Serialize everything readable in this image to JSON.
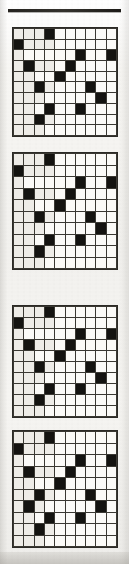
{
  "page": {
    "kind": "scanned-puzzle-page",
    "background_color": "#f4f3f0",
    "rule_color": "#262420",
    "grid_line_color": "#3a3832",
    "cell_empty_color": "#fbfaf7",
    "cell_filled_color": "#141310"
  },
  "grids": [
    {
      "name": "grid-1",
      "rows": 10,
      "cols": 10,
      "filled": [
        [
          0,
          0,
          0,
          1,
          0,
          0,
          0,
          0,
          0,
          0
        ],
        [
          1,
          0,
          0,
          0,
          0,
          0,
          0,
          0,
          0,
          0
        ],
        [
          0,
          0,
          0,
          0,
          0,
          0,
          1,
          0,
          0,
          1
        ],
        [
          0,
          1,
          0,
          0,
          0,
          1,
          0,
          0,
          0,
          0
        ],
        [
          0,
          0,
          0,
          0,
          1,
          0,
          0,
          0,
          0,
          0
        ],
        [
          0,
          0,
          1,
          0,
          0,
          0,
          0,
          1,
          0,
          0
        ],
        [
          0,
          0,
          0,
          0,
          0,
          0,
          0,
          0,
          1,
          0
        ],
        [
          0,
          0,
          0,
          1,
          0,
          0,
          1,
          0,
          0,
          0
        ],
        [
          0,
          0,
          1,
          0,
          0,
          0,
          0,
          0,
          0,
          0
        ],
        [
          0,
          0,
          0,
          0,
          0,
          0,
          0,
          0,
          0,
          0
        ]
      ],
      "shaded": [
        [
          1,
          1,
          1,
          0,
          0,
          0,
          0,
          0,
          0,
          0
        ],
        [
          0,
          1,
          1,
          1,
          0,
          0,
          0,
          0,
          0,
          0
        ],
        [
          1,
          0,
          0,
          0,
          0,
          0,
          0,
          0,
          0,
          0
        ],
        [
          1,
          0,
          1,
          1,
          0,
          0,
          0,
          0,
          0,
          0
        ],
        [
          1,
          1,
          0,
          0,
          0,
          0,
          0,
          0,
          0,
          0
        ],
        [
          1,
          1,
          0,
          1,
          0,
          0,
          0,
          0,
          0,
          0
        ],
        [
          1,
          1,
          1,
          0,
          0,
          0,
          0,
          0,
          0,
          0
        ],
        [
          1,
          1,
          0,
          0,
          0,
          0,
          0,
          0,
          0,
          0
        ],
        [
          1,
          1,
          0,
          1,
          0,
          0,
          0,
          0,
          0,
          0
        ],
        [
          1,
          1,
          1,
          0,
          0,
          0,
          0,
          0,
          0,
          0
        ]
      ]
    },
    {
      "name": "grid-2",
      "rows": 10,
      "cols": 10,
      "filled": [
        [
          0,
          0,
          0,
          1,
          0,
          0,
          0,
          0,
          0,
          0
        ],
        [
          1,
          0,
          0,
          0,
          0,
          0,
          0,
          0,
          0,
          0
        ],
        [
          0,
          0,
          0,
          0,
          0,
          0,
          1,
          0,
          0,
          1
        ],
        [
          0,
          1,
          0,
          0,
          0,
          1,
          0,
          0,
          0,
          0
        ],
        [
          0,
          0,
          0,
          0,
          1,
          0,
          0,
          0,
          0,
          0
        ],
        [
          0,
          0,
          1,
          0,
          0,
          0,
          0,
          1,
          0,
          0
        ],
        [
          0,
          0,
          0,
          0,
          0,
          0,
          0,
          0,
          1,
          0
        ],
        [
          0,
          0,
          0,
          1,
          0,
          0,
          1,
          0,
          0,
          0
        ],
        [
          0,
          0,
          1,
          0,
          0,
          0,
          0,
          0,
          0,
          0
        ],
        [
          0,
          0,
          0,
          0,
          0,
          0,
          0,
          0,
          0,
          0
        ]
      ],
      "shaded": [
        [
          1,
          1,
          1,
          0,
          0,
          0,
          0,
          0,
          0,
          0
        ],
        [
          0,
          1,
          1,
          1,
          0,
          0,
          0,
          0,
          0,
          0
        ],
        [
          1,
          0,
          0,
          0,
          0,
          0,
          0,
          0,
          0,
          0
        ],
        [
          1,
          0,
          1,
          1,
          0,
          0,
          0,
          0,
          0,
          0
        ],
        [
          1,
          1,
          0,
          0,
          0,
          0,
          0,
          0,
          0,
          0
        ],
        [
          1,
          1,
          0,
          1,
          0,
          0,
          0,
          0,
          0,
          0
        ],
        [
          1,
          1,
          1,
          0,
          0,
          0,
          0,
          0,
          0,
          0
        ],
        [
          1,
          1,
          0,
          0,
          0,
          0,
          0,
          0,
          0,
          0
        ],
        [
          1,
          1,
          0,
          1,
          0,
          0,
          0,
          0,
          0,
          0
        ],
        [
          1,
          1,
          1,
          0,
          0,
          0,
          0,
          0,
          0,
          0
        ]
      ]
    },
    {
      "name": "grid-3",
      "rows": 10,
      "cols": 10,
      "filled": [
        [
          0,
          0,
          0,
          1,
          0,
          0,
          0,
          0,
          0,
          0
        ],
        [
          1,
          0,
          0,
          0,
          0,
          0,
          0,
          0,
          0,
          0
        ],
        [
          0,
          0,
          0,
          0,
          0,
          0,
          1,
          0,
          0,
          1
        ],
        [
          0,
          1,
          0,
          0,
          0,
          1,
          0,
          0,
          0,
          0
        ],
        [
          0,
          0,
          0,
          0,
          1,
          0,
          0,
          0,
          0,
          0
        ],
        [
          0,
          0,
          1,
          0,
          0,
          0,
          0,
          1,
          0,
          0
        ],
        [
          0,
          0,
          0,
          0,
          0,
          0,
          0,
          0,
          1,
          0
        ],
        [
          0,
          0,
          0,
          1,
          0,
          0,
          1,
          0,
          0,
          0
        ],
        [
          0,
          0,
          1,
          0,
          0,
          0,
          0,
          0,
          0,
          0
        ],
        [
          0,
          0,
          0,
          0,
          0,
          0,
          0,
          0,
          0,
          0
        ]
      ],
      "shaded": [
        [
          1,
          1,
          1,
          0,
          0,
          0,
          0,
          0,
          0,
          0
        ],
        [
          0,
          1,
          1,
          1,
          0,
          0,
          0,
          0,
          0,
          0
        ],
        [
          1,
          0,
          0,
          0,
          0,
          0,
          0,
          0,
          0,
          0
        ],
        [
          1,
          0,
          1,
          1,
          0,
          0,
          0,
          0,
          0,
          0
        ],
        [
          1,
          1,
          0,
          0,
          0,
          0,
          0,
          0,
          0,
          0
        ],
        [
          1,
          1,
          0,
          1,
          0,
          0,
          0,
          0,
          0,
          0
        ],
        [
          1,
          1,
          1,
          0,
          0,
          0,
          0,
          0,
          0,
          0
        ],
        [
          1,
          1,
          0,
          0,
          0,
          0,
          0,
          0,
          0,
          0
        ],
        [
          1,
          1,
          0,
          1,
          0,
          0,
          0,
          0,
          0,
          0
        ],
        [
          1,
          1,
          1,
          0,
          0,
          0,
          0,
          0,
          0,
          0
        ]
      ]
    },
    {
      "name": "grid-4",
      "rows": 10,
      "cols": 10,
      "filled": [
        [
          0,
          0,
          0,
          1,
          0,
          0,
          0,
          0,
          0,
          0
        ],
        [
          1,
          0,
          0,
          0,
          0,
          0,
          0,
          0,
          0,
          0
        ],
        [
          0,
          0,
          0,
          0,
          0,
          0,
          1,
          0,
          0,
          1
        ],
        [
          0,
          1,
          0,
          0,
          0,
          1,
          0,
          0,
          0,
          0
        ],
        [
          0,
          0,
          0,
          0,
          1,
          0,
          0,
          0,
          0,
          0
        ],
        [
          0,
          0,
          1,
          0,
          0,
          0,
          0,
          1,
          0,
          0
        ],
        [
          0,
          1,
          0,
          0,
          0,
          0,
          0,
          0,
          1,
          0
        ],
        [
          0,
          0,
          0,
          1,
          0,
          0,
          1,
          0,
          0,
          0
        ],
        [
          0,
          0,
          1,
          0,
          0,
          0,
          0,
          0,
          0,
          0
        ],
        [
          0,
          0,
          0,
          0,
          0,
          0,
          0,
          0,
          0,
          0
        ]
      ],
      "shaded": [
        [
          1,
          1,
          1,
          0,
          0,
          0,
          0,
          0,
          0,
          0
        ],
        [
          0,
          1,
          1,
          1,
          0,
          0,
          0,
          0,
          0,
          0
        ],
        [
          1,
          0,
          0,
          0,
          0,
          0,
          0,
          0,
          0,
          0
        ],
        [
          1,
          0,
          1,
          1,
          0,
          0,
          0,
          0,
          0,
          0
        ],
        [
          1,
          1,
          0,
          0,
          0,
          0,
          0,
          0,
          0,
          0
        ],
        [
          1,
          1,
          0,
          1,
          0,
          0,
          0,
          0,
          0,
          0
        ],
        [
          1,
          0,
          1,
          0,
          0,
          0,
          0,
          0,
          0,
          0
        ],
        [
          1,
          1,
          0,
          0,
          0,
          0,
          0,
          0,
          0,
          0
        ],
        [
          1,
          1,
          0,
          1,
          0,
          0,
          0,
          0,
          0,
          0
        ],
        [
          1,
          1,
          1,
          0,
          0,
          0,
          0,
          0,
          0,
          0
        ]
      ]
    }
  ]
}
